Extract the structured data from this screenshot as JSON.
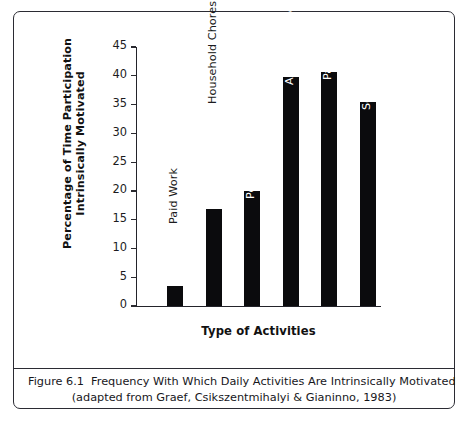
{
  "figure": {
    "caption_number": "Figure 6.1",
    "caption_line1": "Frequency With Which Daily Activities Are Intrinsically Motivated",
    "caption_line2": "(adapted from Graef, Csikszentmihalyi & Gianinno, 1983)"
  },
  "axis_titles": {
    "y_line1": "Percentage of Time Participation",
    "y_line2": "Intrinsically Motivated",
    "x": "Type of Activities"
  },
  "colors": {
    "bar": "#0b0b0d",
    "axis": "#23232a",
    "frame": "#2b2b33",
    "background": "#ffffff",
    "label_dark": "#1b1b20",
    "label_light": "#ffffff"
  },
  "chart_data": {
    "type": "bar",
    "title": "Frequency With Which Daily Activities Are Intrinsically Motivated",
    "xlabel": "Type of Activities",
    "ylabel": "Percentage of Time Participation Intrinsically Motivated",
    "ylim": [
      0,
      45
    ],
    "yticks": [
      0,
      5,
      10,
      15,
      20,
      25,
      30,
      35,
      40,
      45
    ],
    "ytick_labels": [
      "0",
      "5",
      "10",
      "15",
      "20",
      "25",
      "30",
      "35",
      "40",
      "45"
    ],
    "grid": false,
    "legend": false,
    "categories": [
      "Paid Work",
      "Household Chores",
      "Personal Care",
      "Active Leisure",
      "Passive Leisure",
      "Socializing"
    ],
    "values": [
      3.5,
      16.8,
      20.0,
      39.8,
      40.7,
      35.5
    ]
  }
}
